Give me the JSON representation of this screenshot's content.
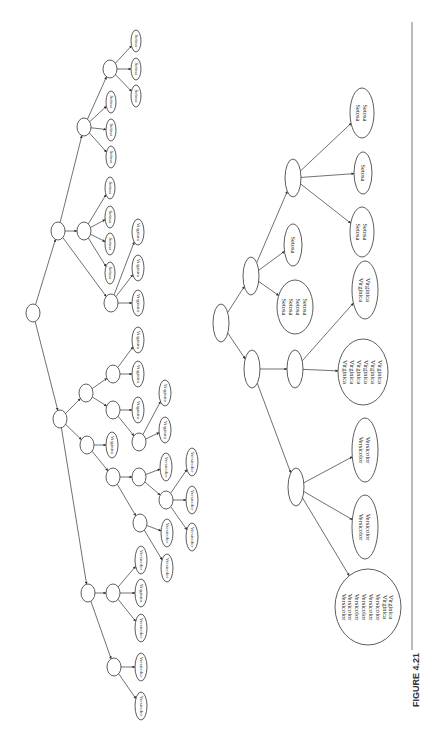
{
  "figure": {
    "caption": "FIGURE 4.21",
    "caption_pos": [
      416,
      680
    ],
    "divider": {
      "x": 412,
      "y1": 22,
      "y2": 650
    }
  },
  "trees": [
    {
      "name": "unpruned-decision-tree",
      "leaf_font_size": 5,
      "nodes": [
        {
          "id": "root",
          "x": 33,
          "y": 313,
          "rx": 7,
          "ry": 9,
          "labels": []
        },
        {
          "id": "P",
          "x": 58,
          "y": 231,
          "rx": 7,
          "ry": 9,
          "labels": []
        },
        {
          "id": "R",
          "x": 84,
          "y": 127,
          "rx": 7,
          "ry": 9,
          "labels": []
        },
        {
          "id": "S",
          "x": 110,
          "y": 69,
          "rx": 7,
          "ry": 9,
          "labels": []
        },
        {
          "id": "S1",
          "x": 136,
          "y": 41,
          "rx": 5,
          "ry": 11,
          "labels": [
            "Setosa"
          ]
        },
        {
          "id": "S2",
          "x": 136,
          "y": 69,
          "rx": 5,
          "ry": 11,
          "labels": [
            "Setosa"
          ]
        },
        {
          "id": "S3",
          "x": 136,
          "y": 96,
          "rx": 5,
          "ry": 11,
          "labels": [
            "Setosa"
          ]
        },
        {
          "id": "R1",
          "x": 111,
          "y": 102,
          "rx": 5,
          "ry": 11,
          "labels": [
            "Setosa"
          ]
        },
        {
          "id": "R2",
          "x": 111,
          "y": 130,
          "rx": 5,
          "ry": 11,
          "labels": [
            "Setosa"
          ]
        },
        {
          "id": "R3",
          "x": 111,
          "y": 157,
          "rx": 5,
          "ry": 11,
          "labels": [
            "Setosa"
          ]
        },
        {
          "id": "Q",
          "x": 84,
          "y": 231,
          "rx": 7,
          "ry": 9,
          "labels": []
        },
        {
          "id": "Q1",
          "x": 110,
          "y": 188,
          "rx": 5,
          "ry": 11,
          "labels": [
            "Setosa"
          ]
        },
        {
          "id": "Q2",
          "x": 110,
          "y": 217,
          "rx": 5,
          "ry": 11,
          "labels": [
            "Setosa"
          ]
        },
        {
          "id": "Q3",
          "x": 110,
          "y": 244,
          "rx": 5,
          "ry": 11,
          "labels": [
            "Setosa"
          ]
        },
        {
          "id": "Q4",
          "x": 110,
          "y": 273,
          "rx": 5,
          "ry": 11,
          "labels": [
            "Setosa"
          ]
        },
        {
          "id": "Vn",
          "x": 111,
          "y": 303,
          "rx": 7,
          "ry": 9,
          "labels": []
        },
        {
          "id": "Vn1",
          "x": 138,
          "y": 232,
          "rx": 6,
          "ry": 13,
          "labels": [
            "Virginica"
          ]
        },
        {
          "id": "Vn2",
          "x": 138,
          "y": 268,
          "rx": 6,
          "ry": 13,
          "labels": [
            "Virginica"
          ]
        },
        {
          "id": "Vn3",
          "x": 138,
          "y": 303,
          "rx": 6,
          "ry": 13,
          "labels": [
            "Virginica"
          ]
        },
        {
          "id": "A",
          "x": 60,
          "y": 419,
          "rx": 7,
          "ry": 9,
          "labels": []
        },
        {
          "id": "B",
          "x": 86,
          "y": 393,
          "rx": 7,
          "ry": 9,
          "labels": []
        },
        {
          "id": "C",
          "x": 113,
          "y": 374,
          "rx": 7,
          "ry": 9,
          "labels": []
        },
        {
          "id": "C1",
          "x": 138,
          "y": 340,
          "rx": 6,
          "ry": 13,
          "labels": [
            "Virginica"
          ]
        },
        {
          "id": "C2",
          "x": 138,
          "y": 374,
          "rx": 6,
          "ry": 13,
          "labels": [
            "Virginica"
          ]
        },
        {
          "id": "D",
          "x": 113,
          "y": 410,
          "rx": 7,
          "ry": 9,
          "labels": []
        },
        {
          "id": "D1",
          "x": 138,
          "y": 410,
          "rx": 6,
          "ry": 13,
          "labels": [
            "Virginica"
          ]
        },
        {
          "id": "E",
          "x": 139,
          "y": 442,
          "rx": 7,
          "ry": 9,
          "labels": []
        },
        {
          "id": "E1",
          "x": 165,
          "y": 393,
          "rx": 6,
          "ry": 13,
          "labels": [
            "Virginica"
          ]
        },
        {
          "id": "E2",
          "x": 165,
          "y": 430,
          "rx": 6,
          "ry": 13,
          "labels": [
            "Virginica"
          ]
        },
        {
          "id": "F",
          "x": 87,
          "y": 445,
          "rx": 7,
          "ry": 9,
          "labels": []
        },
        {
          "id": "F1",
          "x": 112,
          "y": 445,
          "rx": 6,
          "ry": 13,
          "labels": [
            "Virginica"
          ]
        },
        {
          "id": "G",
          "x": 113,
          "y": 477,
          "rx": 7,
          "ry": 9,
          "labels": []
        },
        {
          "id": "H",
          "x": 139,
          "y": 477,
          "rx": 7,
          "ry": 9,
          "labels": []
        },
        {
          "id": "H1",
          "x": 166,
          "y": 467,
          "rx": 6,
          "ry": 14,
          "labels": [
            "Versicolor"
          ]
        },
        {
          "id": "J",
          "x": 166,
          "y": 500,
          "rx": 7,
          "ry": 9,
          "labels": []
        },
        {
          "id": "J1",
          "x": 192,
          "y": 462,
          "rx": 6,
          "ry": 14,
          "labels": [
            "Versicolor"
          ]
        },
        {
          "id": "J2",
          "x": 192,
          "y": 500,
          "rx": 6,
          "ry": 14,
          "labels": [
            "Versicolor"
          ]
        },
        {
          "id": "J3",
          "x": 192,
          "y": 537,
          "rx": 6,
          "ry": 14,
          "labels": [
            "Versicolor"
          ]
        },
        {
          "id": "I",
          "x": 140,
          "y": 523,
          "rx": 7,
          "ry": 9,
          "labels": []
        },
        {
          "id": "I1",
          "x": 167,
          "y": 533,
          "rx": 6,
          "ry": 14,
          "labels": [
            "Versicolor"
          ]
        },
        {
          "id": "I2",
          "x": 167,
          "y": 568,
          "rx": 6,
          "ry": 14,
          "labels": [
            "Versicolor"
          ]
        },
        {
          "id": "K",
          "x": 88,
          "y": 593,
          "rx": 7,
          "ry": 9,
          "labels": []
        },
        {
          "id": "L",
          "x": 113,
          "y": 593,
          "rx": 7,
          "ry": 9,
          "labels": []
        },
        {
          "id": "L1",
          "x": 141,
          "y": 560,
          "rx": 6,
          "ry": 14,
          "labels": [
            "Versicolor"
          ]
        },
        {
          "id": "L2",
          "x": 141,
          "y": 593,
          "rx": 6,
          "ry": 14,
          "labels": [
            "Virginica"
          ]
        },
        {
          "id": "L3",
          "x": 141,
          "y": 628,
          "rx": 6,
          "ry": 14,
          "labels": [
            "Versicolor"
          ]
        },
        {
          "id": "M",
          "x": 114,
          "y": 667,
          "rx": 7,
          "ry": 9,
          "labels": []
        },
        {
          "id": "M1",
          "x": 141,
          "y": 667,
          "rx": 6,
          "ry": 14,
          "labels": [
            "Versicolor"
          ]
        },
        {
          "id": "M2",
          "x": 141,
          "y": 706,
          "rx": 6,
          "ry": 14,
          "labels": [
            "Versicolor"
          ]
        }
      ],
      "edges": [
        [
          "root",
          "P"
        ],
        [
          "root",
          "A"
        ],
        [
          "P",
          "R"
        ],
        [
          "P",
          "Q"
        ],
        [
          "P",
          "Vn"
        ],
        [
          "R",
          "S"
        ],
        [
          "R",
          "R1"
        ],
        [
          "R",
          "R2"
        ],
        [
          "R",
          "R3"
        ],
        [
          "S",
          "S1"
        ],
        [
          "S",
          "S2"
        ],
        [
          "S",
          "S3"
        ],
        [
          "Q",
          "Q1"
        ],
        [
          "Q",
          "Q2"
        ],
        [
          "Q",
          "Q3"
        ],
        [
          "Q",
          "Q4"
        ],
        [
          "Vn",
          "Vn1"
        ],
        [
          "Vn",
          "Vn2"
        ],
        [
          "Vn",
          "Vn3"
        ],
        [
          "A",
          "B"
        ],
        [
          "A",
          "F"
        ],
        [
          "A",
          "K"
        ],
        [
          "B",
          "C"
        ],
        [
          "B",
          "D"
        ],
        [
          "C",
          "C1"
        ],
        [
          "C",
          "C2"
        ],
        [
          "D",
          "D1"
        ],
        [
          "D",
          "E"
        ],
        [
          "E",
          "E1"
        ],
        [
          "E",
          "E2"
        ],
        [
          "F",
          "F1"
        ],
        [
          "F",
          "G"
        ],
        [
          "G",
          "H"
        ],
        [
          "G",
          "I"
        ],
        [
          "H",
          "H1"
        ],
        [
          "H",
          "J"
        ],
        [
          "J",
          "J1"
        ],
        [
          "J",
          "J2"
        ],
        [
          "J",
          "J3"
        ],
        [
          "I",
          "I1"
        ],
        [
          "I",
          "I2"
        ],
        [
          "K",
          "L"
        ],
        [
          "K",
          "M"
        ],
        [
          "L",
          "L1"
        ],
        [
          "L",
          "L2"
        ],
        [
          "L",
          "L3"
        ],
        [
          "M",
          "M1"
        ],
        [
          "M",
          "M2"
        ]
      ]
    },
    {
      "name": "pruned-decision-tree",
      "leaf_font_size": 6.5,
      "nodes": [
        {
          "id": "root2",
          "x": 221,
          "y": 323,
          "rx": 8,
          "ry": 19,
          "labels": []
        },
        {
          "id": "T",
          "x": 251,
          "y": 276,
          "rx": 8,
          "ry": 19,
          "labels": []
        },
        {
          "id": "T1",
          "x": 293,
          "y": 245,
          "rx": 9,
          "ry": 21,
          "labels": [
            "Setosa"
          ]
        },
        {
          "id": "T2",
          "x": 295,
          "y": 307,
          "rx": 18,
          "ry": 27,
          "labels": [
            "Setosa",
            "Setosa",
            "Setosa",
            "Setosa"
          ]
        },
        {
          "id": "U",
          "x": 293,
          "y": 178,
          "rx": 8,
          "ry": 19,
          "labels": []
        },
        {
          "id": "U1",
          "x": 362,
          "y": 113,
          "rx": 12,
          "ry": 25,
          "labels": [
            "Setosa",
            "Setosa"
          ]
        },
        {
          "id": "U2",
          "x": 363,
          "y": 173,
          "rx": 9,
          "ry": 21,
          "labels": [
            "Setosa"
          ]
        },
        {
          "id": "U3",
          "x": 362,
          "y": 232,
          "rx": 12,
          "ry": 25,
          "labels": [
            "Setosa",
            "Setosa"
          ]
        },
        {
          "id": "V",
          "x": 252,
          "y": 369,
          "rx": 8,
          "ry": 19,
          "labels": []
        },
        {
          "id": "W",
          "x": 295,
          "y": 369,
          "rx": 8,
          "ry": 19,
          "labels": []
        },
        {
          "id": "W1",
          "x": 365,
          "y": 290,
          "rx": 13,
          "ry": 29,
          "labels": [
            "Virginica",
            "Virginica"
          ]
        },
        {
          "id": "W2",
          "x": 363,
          "y": 372,
          "rx": 25,
          "ry": 33,
          "labels": [
            "Virginica",
            "Virginica",
            "Virginica",
            "Virginica",
            "Virginica",
            "Virginica"
          ]
        },
        {
          "id": "X",
          "x": 296,
          "y": 487,
          "rx": 8,
          "ry": 19,
          "labels": []
        },
        {
          "id": "X1",
          "x": 365,
          "y": 450,
          "rx": 13,
          "ry": 32,
          "labels": [
            "Versicolor",
            "Versicolor"
          ]
        },
        {
          "id": "X2",
          "x": 365,
          "y": 527,
          "rx": 13,
          "ry": 32,
          "labels": [
            "Versicolor",
            "Versicolor"
          ]
        },
        {
          "id": "X3",
          "x": 368,
          "y": 607,
          "rx": 33,
          "ry": 38,
          "labels": [
            "Versicolor",
            "Versicolor",
            "Versicolor",
            "Versicolor",
            "Versicolor",
            "Versicolor",
            "Virginica",
            "Virginica"
          ]
        }
      ],
      "edges": [
        [
          "root2",
          "T"
        ],
        [
          "root2",
          "V"
        ],
        [
          "T",
          "U"
        ],
        [
          "T",
          "T1"
        ],
        [
          "T",
          "T2"
        ],
        [
          "U",
          "U1"
        ],
        [
          "U",
          "U2"
        ],
        [
          "U",
          "U3"
        ],
        [
          "V",
          "W"
        ],
        [
          "V",
          "X"
        ],
        [
          "W",
          "W1"
        ],
        [
          "W",
          "W2"
        ],
        [
          "X",
          "X1"
        ],
        [
          "X",
          "X2"
        ],
        [
          "X",
          "X3"
        ]
      ]
    }
  ]
}
